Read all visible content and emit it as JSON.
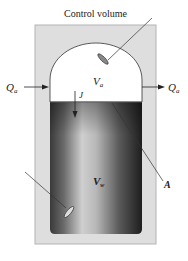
{
  "diagram": {
    "title_label": "Control volume",
    "inflow_label": "Q",
    "inflow_sub": "a",
    "outflow_label": "Q",
    "outflow_sub": "a",
    "air_volume_label": "V",
    "air_volume_sub": "a",
    "flux_label": "J",
    "water_volume_label": "V",
    "water_volume_sub": "w",
    "area_label": "A",
    "colors": {
      "outer_box": "#dcdcdc",
      "outer_border": "#b0b0b0",
      "air_space": "#ffffff",
      "water_dark": "#2b2b2b",
      "water_light": "#c8c8c8",
      "line": "#333333"
    }
  }
}
